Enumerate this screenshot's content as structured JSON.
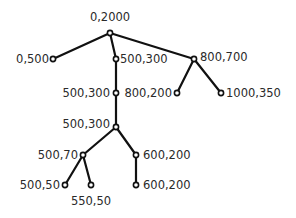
{
  "diagram": {
    "type": "tree",
    "nodes": [
      {
        "id": "n0",
        "label": "0,2000",
        "x": 110,
        "y": 33,
        "lx": 110,
        "ly": 21,
        "anchor": "middle"
      },
      {
        "id": "n1",
        "label": "0,500",
        "x": 53,
        "y": 59,
        "lx": 49,
        "ly": 63,
        "anchor": "end"
      },
      {
        "id": "n2",
        "label": "500,300",
        "x": 116,
        "y": 59,
        "lx": 120,
        "ly": 63,
        "anchor": "start"
      },
      {
        "id": "n3",
        "label": "800,700",
        "x": 194,
        "y": 59,
        "lx": 200,
        "ly": 61,
        "anchor": "start"
      },
      {
        "id": "n4",
        "label": "500,300",
        "x": 116,
        "y": 93,
        "lx": 110,
        "ly": 97,
        "anchor": "end"
      },
      {
        "id": "n5",
        "label": "800,200",
        "x": 177,
        "y": 93,
        "lx": 172,
        "ly": 97,
        "anchor": "end"
      },
      {
        "id": "n6",
        "label": "1000,350",
        "x": 221,
        "y": 93,
        "lx": 226,
        "ly": 97,
        "anchor": "start"
      },
      {
        "id": "n7",
        "label": "500,300",
        "x": 116,
        "y": 127,
        "lx": 110,
        "ly": 128,
        "anchor": "end"
      },
      {
        "id": "n8",
        "label": "500,70",
        "x": 83,
        "y": 155,
        "lx": 78,
        "ly": 159,
        "anchor": "end"
      },
      {
        "id": "n9",
        "label": "600,200",
        "x": 136,
        "y": 155,
        "lx": 143,
        "ly": 159,
        "anchor": "start"
      },
      {
        "id": "n10",
        "label": "500,50",
        "x": 65,
        "y": 185,
        "lx": 60,
        "ly": 189,
        "anchor": "end"
      },
      {
        "id": "n11",
        "label": "550,50",
        "x": 91,
        "y": 185,
        "lx": 91,
        "ly": 205,
        "anchor": "middle"
      },
      {
        "id": "n12",
        "label": "600,200",
        "x": 136,
        "y": 185,
        "lx": 143,
        "ly": 189,
        "anchor": "start"
      }
    ],
    "edges": [
      [
        "n0",
        "n1"
      ],
      [
        "n0",
        "n2"
      ],
      [
        "n0",
        "n3"
      ],
      [
        "n2",
        "n4"
      ],
      [
        "n3",
        "n5"
      ],
      [
        "n3",
        "n6"
      ],
      [
        "n4",
        "n7"
      ],
      [
        "n7",
        "n8"
      ],
      [
        "n7",
        "n9"
      ],
      [
        "n8",
        "n10"
      ],
      [
        "n8",
        "n11"
      ],
      [
        "n9",
        "n12"
      ]
    ],
    "colors": {
      "line": "#111111",
      "text": "#2a2a2a",
      "background": "#ffffff"
    }
  }
}
